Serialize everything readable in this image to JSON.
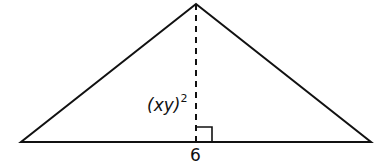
{
  "diagram": {
    "type": "triangle",
    "vertices": {
      "apex": [
        196,
        4
      ],
      "base_left": [
        21,
        142
      ],
      "base_right": [
        371,
        142
      ]
    },
    "height_line": {
      "style": "dashed",
      "from": [
        196,
        4
      ],
      "to": [
        196,
        142
      ]
    },
    "right_angle_marker": {
      "at": [
        196,
        142
      ],
      "size": 16
    },
    "labels": {
      "height_base": "(xy)",
      "height_exponent": "2",
      "base": "6"
    },
    "colors": {
      "stroke": "#111111",
      "background": "#ffffff"
    }
  }
}
